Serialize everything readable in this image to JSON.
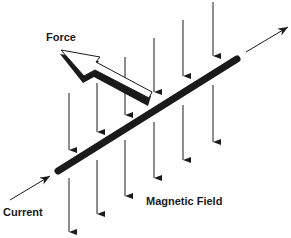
{
  "diagram": {
    "labels": {
      "force": "Force",
      "current": "Current",
      "magnetic_field": "Magnetic Field"
    },
    "colors": {
      "ink": "#1a1a1a",
      "background": "#ffffff"
    },
    "elements": {
      "wire": "straight-conductor",
      "force_arrow": "hollow-3d-arrow",
      "field_lines": "vertical-downward-arrows",
      "current_arrows": "inline-direction-arrows"
    }
  }
}
